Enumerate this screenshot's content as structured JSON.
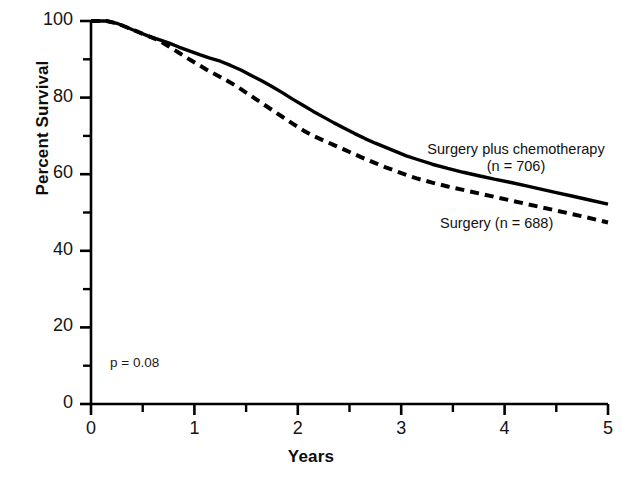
{
  "chart_data": {
    "type": "line",
    "title": "",
    "xlabel": "Years",
    "ylabel": "Percent Survival",
    "xlim": [
      0,
      5
    ],
    "ylim": [
      0,
      100
    ],
    "grid": false,
    "legend_position": "inline-right",
    "x_major_ticks": [
      0,
      1,
      2,
      3,
      4,
      5
    ],
    "x_minor_ticks": [
      0.5,
      1.5,
      2.5,
      3.5,
      4.5
    ],
    "y_major_ticks": [
      0,
      20,
      40,
      60,
      80,
      100
    ],
    "y_minor_ticks": [
      10,
      30,
      50,
      70,
      90
    ],
    "x_tick_labels": [
      "0",
      "1",
      "2",
      "3",
      "4",
      "5"
    ],
    "y_tick_labels": [
      "0",
      "20",
      "40",
      "60",
      "80",
      "100"
    ],
    "annotations": [
      {
        "name": "p-value",
        "text": "p = 0.08",
        "x": 0.2,
        "y": 12
      }
    ],
    "series": [
      {
        "name": "Surgery plus chemotherapy",
        "label": "Surgery plus chemotherapy",
        "sublabel": "(n = 706)",
        "n": 706,
        "style": "solid",
        "color": "#000000",
        "x": [
          0.0,
          0.15,
          0.25,
          0.35,
          0.45,
          0.55,
          0.65,
          0.75,
          0.85,
          0.95,
          1.05,
          1.15,
          1.25,
          1.35,
          1.45,
          1.55,
          1.65,
          1.75,
          1.85,
          1.95,
          2.05,
          2.15,
          2.25,
          2.35,
          2.45,
          2.55,
          2.65,
          2.75,
          2.85,
          2.95,
          3.05,
          3.15,
          3.3,
          3.45,
          3.6,
          3.75,
          3.9,
          4.05,
          4.2,
          4.35,
          4.5,
          4.65,
          4.8,
          5.0
        ],
        "y": [
          100.0,
          100.0,
          99.4,
          98.3,
          97.2,
          96.1,
          95.2,
          94.3,
          93.2,
          92.2,
          91.2,
          90.3,
          89.5,
          88.4,
          87.2,
          85.8,
          84.4,
          82.9,
          81.3,
          79.6,
          78.0,
          76.4,
          74.9,
          73.4,
          72.0,
          70.6,
          69.3,
          68.1,
          67.0,
          65.9,
          64.8,
          63.9,
          62.6,
          61.5,
          60.5,
          59.6,
          58.7,
          57.9,
          57.0,
          56.1,
          55.2,
          54.3,
          53.4,
          52.2
        ]
      },
      {
        "name": "Surgery",
        "label": "Surgery (n = 688)",
        "sublabel": "",
        "n": 688,
        "style": "dashed",
        "color": "#000000",
        "x": [
          0.0,
          0.15,
          0.25,
          0.35,
          0.45,
          0.55,
          0.65,
          0.75,
          0.85,
          0.95,
          1.05,
          1.15,
          1.25,
          1.35,
          1.45,
          1.55,
          1.65,
          1.75,
          1.85,
          1.95,
          2.05,
          2.15,
          2.25,
          2.35,
          2.45,
          2.55,
          2.65,
          2.75,
          2.85,
          2.95,
          3.05,
          3.15,
          3.3,
          3.45,
          3.6,
          3.75,
          3.9,
          4.05,
          4.2,
          4.35,
          4.5,
          4.65,
          4.8,
          5.0
        ],
        "y": [
          100.0,
          100.0,
          99.4,
          98.3,
          97.2,
          96.1,
          95.0,
          93.4,
          91.7,
          90.0,
          88.4,
          86.8,
          85.4,
          83.9,
          82.2,
          80.4,
          78.6,
          76.8,
          75.0,
          73.2,
          71.5,
          70.0,
          68.8,
          67.6,
          66.4,
          65.2,
          64.0,
          62.9,
          61.8,
          60.8,
          59.8,
          58.9,
          57.8,
          56.8,
          55.9,
          55.0,
          54.1,
          53.2,
          52.3,
          51.4,
          50.5,
          49.6,
          48.7,
          47.4
        ]
      }
    ]
  },
  "labels": {
    "series0_line1": "Surgery plus chemotherapy",
    "series0_line2": "(n = 706)",
    "series1_line1": "Surgery (n = 688)",
    "pvalue": "p = 0.08",
    "xlabel": "Years",
    "ylabel": "Percent Survival",
    "ytick0": "0",
    "ytick1": "20",
    "ytick2": "40",
    "ytick3": "60",
    "ytick4": "80",
    "ytick5": "100",
    "xtick0": "0",
    "xtick1": "1",
    "xtick2": "2",
    "xtick3": "3",
    "xtick4": "4",
    "xtick5": "5"
  }
}
